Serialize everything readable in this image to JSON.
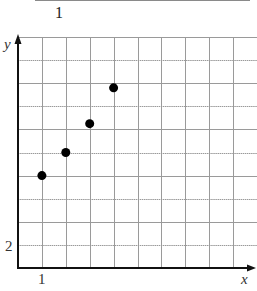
{
  "header": {
    "label": "1"
  },
  "chart_data": {
    "type": "scatter",
    "title": "",
    "xlabel": "x",
    "ylabel": "y",
    "x_tick_labels": [
      {
        "value": 1,
        "label": "1"
      }
    ],
    "y_tick_labels": [
      {
        "value": 2,
        "label": "2"
      }
    ],
    "x_grid_step": 1,
    "y_grid_step": 2,
    "xlim": [
      0,
      10
    ],
    "ylim": [
      0,
      20
    ],
    "grid": true,
    "legend": null,
    "series": [
      {
        "name": "points",
        "x": [
          1,
          2,
          3,
          4
        ],
        "y": [
          8,
          10,
          12.5,
          15.6
        ]
      }
    ]
  },
  "colors": {
    "grid": "#9a9a9a",
    "axis": "#111111",
    "point": "#000000"
  }
}
